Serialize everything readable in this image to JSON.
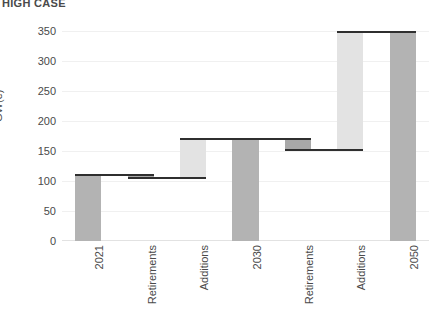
{
  "chart_data": {
    "type": "bar",
    "subtype": "waterfall",
    "title": "HIGH CASE",
    "xlabel": "",
    "ylabel": "GW(e)",
    "ylim": [
      0,
      365
    ],
    "yticks": [
      0,
      50,
      100,
      150,
      200,
      250,
      300,
      350
    ],
    "ytick_labels": [
      "0",
      "50",
      "100",
      "150",
      "200",
      "250",
      "300",
      "350"
    ],
    "grid": true,
    "legend": "none",
    "categories": [
      "2021",
      "Retirements",
      "Additions",
      "2030",
      "Retirements",
      "Additions",
      "2050"
    ],
    "bars": [
      {
        "label": "2021",
        "kind": "total",
        "base": 0,
        "top": 110,
        "value": 110,
        "color": "#b3b3b3"
      },
      {
        "label": "Retirements",
        "kind": "decrease",
        "base": 105,
        "top": 110,
        "value": -5,
        "color": "#a8a8a8"
      },
      {
        "label": "Additions",
        "kind": "increase",
        "base": 105,
        "top": 170,
        "value": 65,
        "color": "#e3e3e3"
      },
      {
        "label": "2030",
        "kind": "total",
        "base": 0,
        "top": 170,
        "value": 170,
        "color": "#b3b3b3"
      },
      {
        "label": "Retirements",
        "kind": "decrease",
        "base": 152,
        "top": 170,
        "value": -18,
        "color": "#a8a8a8"
      },
      {
        "label": "Additions",
        "kind": "increase",
        "base": 152,
        "top": 348,
        "value": 196,
        "color": "#e3e3e3"
      },
      {
        "label": "2050",
        "kind": "total",
        "base": 0,
        "top": 348,
        "value": 348,
        "color": "#b3b3b3"
      }
    ],
    "values": [
      110,
      -5,
      65,
      170,
      -18,
      196,
      348
    ],
    "connector_levels": [
      110,
      105,
      170,
      170,
      152,
      348
    ],
    "colors": {
      "total_bar": "#b3b3b3",
      "decrease_bar": "#a8a8a8",
      "increase_bar": "#e3e3e3",
      "connector": "#2f2f2f",
      "gridline": "#f0f0f0",
      "text": "#4a4a4a"
    }
  }
}
